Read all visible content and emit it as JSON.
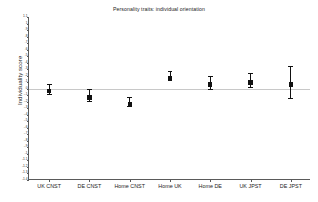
{
  "chart_data": {
    "type": "scatter",
    "title": "Personality traits: individual orientation",
    "xlabel": "",
    "ylabel": "Individuality score",
    "categories": [
      "UK CNST",
      "DE CNST",
      "Home CNST",
      "Home UK",
      "Home DE",
      "UK JPST",
      "DE JPST"
    ],
    "values": [
      0.0,
      -0.1,
      -0.2,
      0.2,
      0.1,
      0.13,
      0.1
    ],
    "ci_low": [
      -0.08,
      -0.19,
      -0.27,
      0.13,
      0.0,
      0.02,
      -0.14
    ],
    "ci_high": [
      0.08,
      -0.01,
      -0.13,
      0.27,
      0.2,
      0.24,
      0.35
    ],
    "ylim": [
      -1.4,
      1.1
    ],
    "ytick_step": 0.1,
    "yticks": [
      1.1,
      1.0,
      0.9,
      0.8,
      0.7,
      0.6,
      0.5,
      0.4,
      0.3,
      0.2,
      0.1,
      0.0,
      -0.1,
      -0.2,
      -0.3,
      -0.4,
      -0.5,
      -0.6,
      -0.7,
      -0.8,
      -0.9,
      -1.0,
      -1.1,
      -1.2,
      -1.3,
      -1.4
    ],
    "ytick_labels": [
      "1.1",
      "1",
      ".9",
      ".8",
      ".7",
      ".6",
      ".5",
      ".4",
      ".3",
      ".2",
      ".1",
      "0",
      "-.1",
      "-.2",
      "-.3",
      "-.4",
      "-.5",
      "-.6",
      "-.7",
      "-.8",
      "-.9",
      "-1",
      "-1.1",
      "-1.2",
      "-1.3",
      "-1.4"
    ],
    "reference_line": 0.0,
    "grid": false,
    "legend": "none",
    "marker_color": "#111111",
    "reference_line_color": "#c8c8c8",
    "axis_color": "#5a5a5a"
  }
}
